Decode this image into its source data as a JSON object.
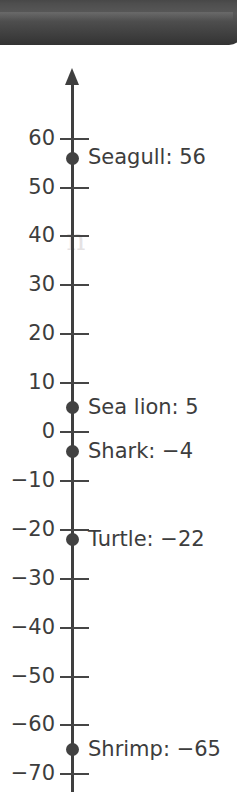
{
  "header": {
    "name": "top-bar",
    "color": "#434343"
  },
  "watermark": {
    "text": "n"
  },
  "chart_data": {
    "type": "scatter",
    "orientation": "vertical-number-line",
    "title": "",
    "xlabel": "",
    "ylabel": "",
    "ylim": [
      -70,
      65
    ],
    "grid": false,
    "legend": "none",
    "axis": {
      "tick_step": 10,
      "arrow_at": "top",
      "tick_labels": [
        "60",
        "50",
        "40",
        "30",
        "20",
        "10",
        "0",
        "−10",
        "−20",
        "−30",
        "−40",
        "−50",
        "−60",
        "−70"
      ],
      "tick_values": [
        60,
        50,
        40,
        30,
        20,
        10,
        0,
        -10,
        -20,
        -30,
        -40,
        -50,
        -60,
        -70
      ]
    },
    "categories": [
      "Seagull",
      "Sea lion",
      "Shark",
      "Turtle",
      "Shrimp"
    ],
    "values": [
      56,
      5,
      -4,
      -22,
      -65
    ],
    "point_labels": [
      "Seagull: 56",
      "Sea lion: 5",
      "Shark: −4",
      "Turtle: −22",
      "Shrimp: −65"
    ],
    "colors": {
      "point": "#424242",
      "axis": "#3f3f3f",
      "text": "#3d3d3d",
      "background": "#ffffff"
    }
  }
}
